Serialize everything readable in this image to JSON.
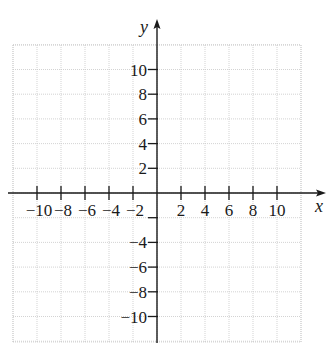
{
  "chart_data": {
    "type": "scatter",
    "title": "",
    "xlabel": "x",
    "ylabel": "y",
    "xlim": [
      -12,
      12
    ],
    "ylim": [
      -12,
      12
    ],
    "grid": true,
    "series": [],
    "x_tick_labels": [
      "−10",
      "−8",
      "−6",
      "−4",
      "−2",
      "2",
      "4",
      "6",
      "8",
      "10"
    ],
    "y_tick_labels": [
      "10",
      "8",
      "6",
      "4",
      "2",
      "−4",
      "−6",
      "−8",
      "−10"
    ],
    "x_ticks": [
      -10,
      -8,
      -6,
      -4,
      -2,
      2,
      4,
      6,
      8,
      10
    ],
    "y_ticks": [
      10,
      8,
      6,
      4,
      2,
      -2,
      -4,
      -6,
      -8,
      -10
    ]
  },
  "axes": {
    "x_label": "x",
    "y_label": "y"
  },
  "colors": {
    "axis": "#1a1a1a",
    "grid": "#c8c8c8",
    "background": "#ffffff"
  }
}
